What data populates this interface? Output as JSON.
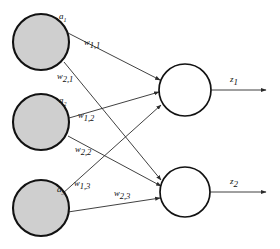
{
  "figure": {
    "type": "neural-network-diagram",
    "background_color": "#ffffff",
    "stroke_color": "#121212",
    "input_node_fill": "#cfcfcf",
    "output_node_fill": "#ffffff"
  },
  "input_layer": {
    "nodes": [
      {
        "id": "a1",
        "label_base": "a",
        "label_sub": "1",
        "cx": 41,
        "cy": 42,
        "r": 28,
        "label_x": 59,
        "label_y": 19
      },
      {
        "id": "a2",
        "label_base": "a",
        "label_sub": "2",
        "cx": 41,
        "cy": 122,
        "r": 28,
        "label_x": 59,
        "label_y": 103
      },
      {
        "id": "a3",
        "label_base": "a",
        "label_sub": "3",
        "cx": 41,
        "cy": 208,
        "r": 28,
        "label_x": 57,
        "label_y": 192
      }
    ]
  },
  "output_layer": {
    "nodes": [
      {
        "id": "z1node",
        "cx": 185,
        "cy": 90,
        "r": 26
      },
      {
        "id": "z2node",
        "cx": 185,
        "cy": 192,
        "r": 25
      }
    ]
  },
  "weights": [
    {
      "id": "w11",
      "base": "w",
      "sub": "1,1",
      "from": "a1",
      "to": "z1node",
      "label_x": 84,
      "label_y": 45
    },
    {
      "id": "w21",
      "base": "w",
      "sub": "2,1",
      "from": "a1",
      "to": "z2node",
      "label_x": 57,
      "label_y": 79
    },
    {
      "id": "w12",
      "base": "w",
      "sub": "1,2",
      "from": "a2",
      "to": "z1node",
      "label_x": 78,
      "label_y": 118
    },
    {
      "id": "w22",
      "base": "w",
      "sub": "2,2",
      "from": "a2",
      "to": "z2node",
      "label_x": 75,
      "label_y": 152
    },
    {
      "id": "w13",
      "base": "w",
      "sub": "1,3",
      "from": "a3",
      "to": "z1node",
      "label_x": 74,
      "label_y": 186
    },
    {
      "id": "w23",
      "base": "w",
      "sub": "2,3",
      "from": "a3",
      "to": "z2node",
      "label_x": 114,
      "label_y": 196
    }
  ],
  "outputs": [
    {
      "id": "z1",
      "base": "z",
      "sub": "1",
      "from": "z1node",
      "x1": 211,
      "y1": 90,
      "x2": 266,
      "y2": 90,
      "label_x": 230,
      "label_y": 82
    },
    {
      "id": "z2",
      "base": "z",
      "sub": "2",
      "from": "z2node",
      "x1": 210,
      "y1": 192,
      "x2": 266,
      "y2": 192,
      "label_x": 230,
      "label_y": 184
    }
  ]
}
